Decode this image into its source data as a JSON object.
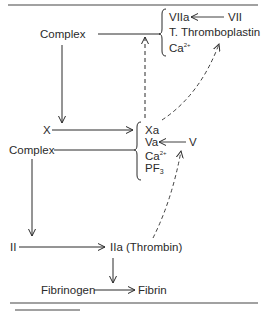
{
  "diagram": {
    "type": "coagulation-cascade",
    "nodes": {
      "complex_top": "Complex",
      "factor_viia": "VIIa",
      "factor_vii": "VII",
      "thromboplastin": "T. Thromboplastin",
      "calcium_top": "Ca",
      "calcium_top_sup": "2+",
      "factor_x": "X",
      "factor_xa": "Xa",
      "factor_va": "Va",
      "factor_v": "V",
      "calcium_mid": "Ca",
      "calcium_mid_sup": "2+",
      "pf3": "PF",
      "pf3_sub": "3",
      "complex_mid": "Complex",
      "factor_ii": "II",
      "factor_iia": "IIa (Thrombin)",
      "fibrinogen": "Fibrinogen",
      "fibrin": "Fibrin"
    },
    "edges": [
      {
        "from": "VII",
        "to": "VIIa",
        "style": "solid"
      },
      {
        "from": "Complex (VIIa, T. Thromboplastin, Ca2+)",
        "to": "X",
        "style": "solid"
      },
      {
        "from": "X",
        "to": "Xa",
        "style": "solid"
      },
      {
        "from": "V",
        "to": "Va",
        "style": "solid"
      },
      {
        "from": "Complex (Xa, Va, Ca2+, PF3)",
        "to": "II",
        "style": "solid"
      },
      {
        "from": "II",
        "to": "IIa (Thrombin)",
        "style": "solid"
      },
      {
        "from": "IIa (Thrombin)",
        "to": "Fibrinogen→Fibrin",
        "style": "solid"
      },
      {
        "from": "Fibrinogen",
        "to": "Fibrin",
        "style": "solid"
      },
      {
        "from": "Xa",
        "to": "Complex (top)",
        "style": "dashed"
      },
      {
        "from": "Xa",
        "to": "T. Thromboplastin / VII",
        "style": "dashed"
      },
      {
        "from": "IIa (Thrombin)",
        "to": "V",
        "style": "dashed"
      }
    ],
    "colors": {
      "ink": "#2a2a2a",
      "background": "#ffffff"
    }
  }
}
